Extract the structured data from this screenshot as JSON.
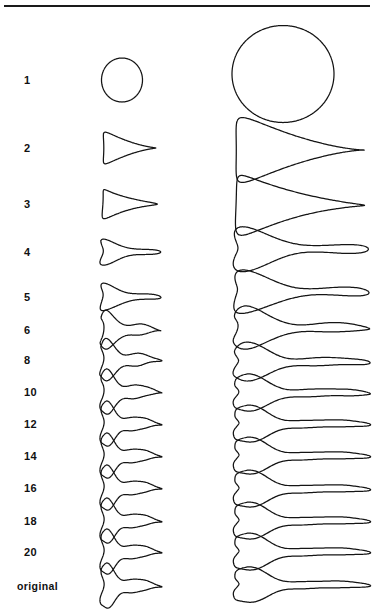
{
  "figure": {
    "title": "",
    "background_color": "#ffffff",
    "stroke_color": "#141414",
    "has_top_rule": true,
    "rows": [
      {
        "label": "1",
        "y": 80,
        "small": {
          "cx": 122,
          "cy": 80,
          "rx": 20.5,
          "ry": 22.0,
          "harmonic": 1
        },
        "large": {
          "cx": 283,
          "cy": 74,
          "rx": 51.0,
          "ry": 48.5,
          "harmonic": 1
        }
      },
      {
        "label": "2",
        "y": 148,
        "small": {
          "cx": 122,
          "cy": 148,
          "rx": 26.0,
          "ry": 12.5,
          "harmonic": 2
        },
        "large": {
          "cx": 283,
          "cy": 150,
          "rx": 64.0,
          "ry": 25.0,
          "harmonic": 2
        }
      },
      {
        "label": "3",
        "y": 204,
        "small": {
          "cx": 122,
          "cy": 204,
          "rx": 27.0,
          "ry": 11.5,
          "harmonic": 3
        },
        "large": {
          "cx": 283,
          "cy": 205,
          "rx": 64.0,
          "ry": 23.0,
          "harmonic": 3
        }
      },
      {
        "label": "4",
        "y": 252,
        "small": {
          "cx": 122,
          "cy": 252,
          "rx": 28.5,
          "ry": 9.5,
          "harmonic": 4
        },
        "large": {
          "cx": 283,
          "cy": 249,
          "rx": 65.0,
          "ry": 15.0,
          "harmonic": 4
        }
      },
      {
        "label": "5",
        "y": 297,
        "small": {
          "cx": 122,
          "cy": 297,
          "rx": 28.5,
          "ry": 10.0,
          "harmonic": 5
        },
        "large": {
          "cx": 283,
          "cy": 292,
          "rx": 65.0,
          "ry": 14.5,
          "harmonic": 5
        }
      },
      {
        "label": "6",
        "y": 330,
        "small": {
          "cx": 122,
          "cy": 330,
          "rx": 28.0,
          "ry": 13.5,
          "harmonic": 6
        },
        "large": {
          "cx": 283,
          "cy": 328,
          "rx": 65.0,
          "ry": 14.0,
          "harmonic": 6
        }
      },
      {
        "label": "8",
        "y": 360,
        "small": {
          "cx": 122,
          "cy": 360,
          "rx": 28.5,
          "ry": 14.5,
          "harmonic": 8
        },
        "large": {
          "cx": 283,
          "cy": 362,
          "rx": 65.0,
          "ry": 12.5,
          "harmonic": 8
        }
      },
      {
        "label": "10",
        "y": 392,
        "small": {
          "cx": 122,
          "cy": 392,
          "rx": 28.5,
          "ry": 15.5,
          "harmonic": 10
        },
        "large": {
          "cx": 283,
          "cy": 393,
          "rx": 65.0,
          "ry": 12.0,
          "harmonic": 10
        }
      },
      {
        "label": "12",
        "y": 424,
        "small": {
          "cx": 122,
          "cy": 424,
          "rx": 28.5,
          "ry": 15.5,
          "harmonic": 12
        },
        "large": {
          "cx": 283,
          "cy": 424,
          "rx": 65.0,
          "ry": 12.0,
          "harmonic": 12
        }
      },
      {
        "label": "14",
        "y": 456,
        "small": {
          "cx": 122,
          "cy": 456,
          "rx": 28.5,
          "ry": 15.5,
          "harmonic": 14
        },
        "large": {
          "cx": 283,
          "cy": 456,
          "rx": 65.0,
          "ry": 12.0,
          "harmonic": 14
        }
      },
      {
        "label": "16",
        "y": 488,
        "small": {
          "cx": 122,
          "cy": 488,
          "rx": 28.5,
          "ry": 15.5,
          "harmonic": 16
        },
        "large": {
          "cx": 283,
          "cy": 489,
          "rx": 65.0,
          "ry": 12.0,
          "harmonic": 16
        }
      },
      {
        "label": "18",
        "y": 521,
        "small": {
          "cx": 122,
          "cy": 521,
          "rx": 28.5,
          "ry": 15.5,
          "harmonic": 18
        },
        "large": {
          "cx": 283,
          "cy": 521,
          "rx": 65.0,
          "ry": 12.0,
          "harmonic": 18
        }
      },
      {
        "label": "20",
        "y": 552,
        "small": {
          "cx": 122,
          "cy": 552,
          "rx": 28.5,
          "ry": 15.5,
          "harmonic": 20
        },
        "large": {
          "cx": 283,
          "cy": 552,
          "rx": 65.0,
          "ry": 12.0,
          "harmonic": 20
        }
      },
      {
        "label": "original",
        "y": 586,
        "small": {
          "cx": 122,
          "cy": 586,
          "rx": 28.5,
          "ry": 15.5,
          "harmonic": 28
        },
        "large": {
          "cx": 283,
          "cy": 585,
          "rx": 65.0,
          "ry": 11.5,
          "harmonic": 28
        }
      }
    ],
    "columns": [
      {
        "name": "small-shape-column",
        "center_x": 122
      },
      {
        "name": "large-shape-column",
        "center_x": 283
      }
    ]
  },
  "chart_data": {
    "type": "line",
    "xlabel": "",
    "ylabel": "number of harmonics",
    "categories": [
      "1",
      "2",
      "3",
      "4",
      "5",
      "6",
      "8",
      "10",
      "12",
      "14",
      "16",
      "18",
      "20",
      "original"
    ],
    "series": [
      {
        "name": "small outline (left column)",
        "values": [
          1,
          2,
          3,
          4,
          5,
          6,
          8,
          10,
          12,
          14,
          16,
          18,
          20,
          28
        ],
        "widths": [
          41,
          52,
          54,
          57,
          57,
          56,
          57,
          57,
          57,
          57,
          57,
          57,
          57,
          57
        ],
        "heights": [
          44,
          25,
          23,
          19,
          20,
          27,
          29,
          31,
          31,
          31,
          31,
          31,
          31,
          31
        ]
      },
      {
        "name": "large outline (right column)",
        "values": [
          1,
          2,
          3,
          4,
          5,
          6,
          8,
          10,
          12,
          14,
          16,
          18,
          20,
          28
        ],
        "widths": [
          102,
          128,
          128,
          130,
          130,
          130,
          130,
          130,
          130,
          130,
          130,
          130,
          130,
          130
        ],
        "heights": [
          97,
          50,
          46,
          30,
          29,
          28,
          25,
          24,
          24,
          24,
          24,
          24,
          23,
          23
        ]
      }
    ],
    "legend_position": "none",
    "grid": false
  }
}
